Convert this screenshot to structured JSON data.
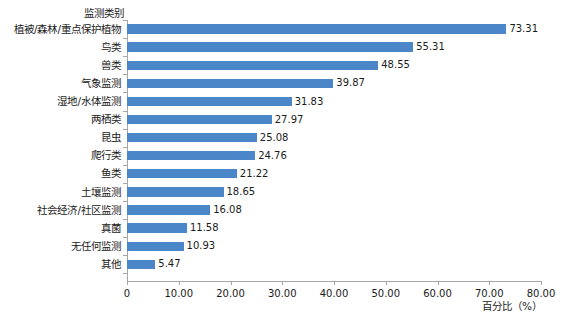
{
  "chart_data": {
    "type": "bar",
    "orientation": "horizontal",
    "title": "",
    "xlabel": "百分比（%）",
    "ylabel": "监测类别",
    "xlim": [
      0,
      80
    ],
    "xticks": [
      "0",
      "10.00",
      "20.00",
      "30.00",
      "40.00",
      "50.00",
      "60.00",
      "70.00",
      "80.00"
    ],
    "xtick_values": [
      0,
      10,
      20,
      30,
      40,
      50,
      60,
      70,
      80
    ],
    "grid": false,
    "legend": false,
    "bar_color": "#4A86C8",
    "axis_color": "#A6A6A6",
    "categories": [
      "植被/森林/重点保护植物",
      "鸟类",
      "兽类",
      "气象监测",
      "湿地/水体监测",
      "两栖类",
      "昆虫",
      "爬行类",
      "鱼类",
      "土壤监测",
      "社会经济/社区监测",
      "真菌",
      "无任何监测",
      "其他"
    ],
    "values": [
      73.31,
      55.31,
      48.55,
      39.87,
      31.83,
      27.97,
      25.08,
      24.76,
      21.22,
      18.65,
      16.08,
      11.58,
      10.93,
      5.47
    ],
    "value_labels": [
      "73.31",
      "55.31",
      "48.55",
      "39.87",
      "31.83",
      "27.97",
      "25.08",
      "24.76",
      "21.22",
      "18.65",
      "16.08",
      "11.58",
      "10.93",
      "5.47"
    ]
  }
}
